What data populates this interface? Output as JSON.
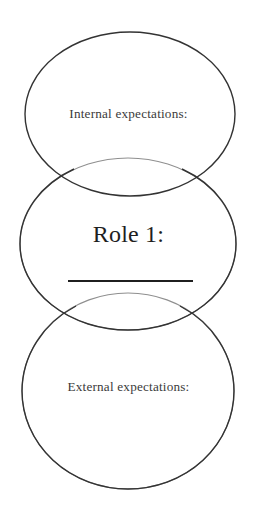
{
  "document": {
    "title": "Role 1 expectations Venn diagram",
    "background_color": "#ffffff"
  },
  "diagram": {
    "type": "venn-three-circle-vertical",
    "stroke_color": "#333333",
    "faint_stroke_color": "#8c8c8c",
    "fill": "none",
    "circles": [
      {
        "id": "top",
        "name": "internal-expectations-circle",
        "cx": 130,
        "cy": 114,
        "rx": 105,
        "ry": 82,
        "stroke": "#333333"
      },
      {
        "id": "middle",
        "name": "role-circle",
        "cx": 128,
        "cy": 244,
        "rx": 108,
        "ry": 86,
        "stroke": "#333333"
      },
      {
        "id": "bottom",
        "name": "external-expectations-circle",
        "cx": 128,
        "cy": 391,
        "rx": 106,
        "ry": 98,
        "stroke": "#333333"
      }
    ],
    "labels": {
      "internal": "Internal expectations:",
      "role": "Role 1:",
      "external": "External expectations:"
    },
    "blank_line": {
      "name": "role-fill-in-line",
      "x1": 68,
      "x2": 193,
      "y": 281,
      "thickness": 1.8,
      "color": "#1f1f1f"
    }
  }
}
